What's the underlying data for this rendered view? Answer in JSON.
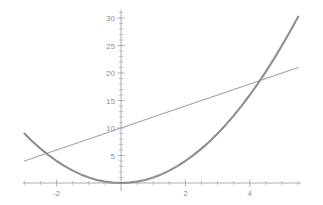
{
  "chart_data": {
    "type": "line",
    "title": "",
    "subtitle": "",
    "xlabel": "",
    "ylabel": "",
    "xlim": [
      -3.05,
      5.6
    ],
    "ylim": [
      -1.5,
      31.5
    ],
    "grid": false,
    "legend": "none",
    "background_color": "#ffffff",
    "axis_color": "#9a9aa2",
    "x_ticks_major": [
      -2,
      2,
      4
    ],
    "x_tick_labels": [
      "-2",
      "2",
      "4"
    ],
    "x_ticks_minor": [
      -3,
      -2.5,
      -1.5,
      -1,
      -0.5,
      0.5,
      1,
      1.5,
      2.5,
      3,
      3.5,
      4.5,
      5,
      5.5
    ],
    "y_ticks_major": [
      5,
      10,
      15,
      20,
      25,
      30
    ],
    "y_tick_labels": [
      "5",
      "10",
      "15",
      "20",
      "25",
      "30"
    ],
    "y_ticks_minor": [
      1,
      2,
      3,
      4,
      6,
      7,
      8,
      9,
      11,
      12,
      13,
      14,
      16,
      17,
      18,
      19,
      21,
      22,
      23,
      24,
      26,
      27,
      28,
      29,
      31
    ],
    "series": [
      {
        "name": "parabola",
        "expression": "y = x^2",
        "color": "#8e8e96",
        "stroke_width": 2.1,
        "x": [
          -3.0,
          -2.75,
          -2.5,
          -2.25,
          -2.0,
          -1.75,
          -1.5,
          -1.25,
          -1.0,
          -0.75,
          -0.5,
          -0.25,
          0.0,
          0.25,
          0.5,
          0.75,
          1.0,
          1.25,
          1.5,
          1.75,
          2.0,
          2.25,
          2.5,
          2.75,
          3.0,
          3.25,
          3.5,
          3.75,
          4.0,
          4.25,
          4.5,
          4.75,
          5.0,
          5.25,
          5.5
        ],
        "y": [
          9.0,
          7.5625,
          6.25,
          5.0625,
          4.0,
          3.0625,
          2.25,
          1.5625,
          1.0,
          0.5625,
          0.25,
          0.0625,
          0.0,
          0.0625,
          0.25,
          0.5625,
          1.0,
          1.5625,
          2.25,
          3.0625,
          4.0,
          5.0625,
          6.25,
          7.5625,
          9.0,
          10.5625,
          12.25,
          14.0625,
          16.0,
          18.0625,
          20.25,
          22.5625,
          25.0,
          27.5625,
          30.25
        ]
      },
      {
        "name": "tangent-line",
        "expression": "y = 2x + 10",
        "color": "#a3a3ad",
        "stroke_width": 1.2,
        "x": [
          -3.0,
          5.5
        ],
        "y": [
          4.0,
          21.0
        ]
      }
    ],
    "annotations": [],
    "intersections": [
      {
        "x": -2.4,
        "y": 5.2
      },
      {
        "x": 4.4,
        "y": 18.8
      }
    ]
  },
  "figure": {
    "name": "quadratic-and-line-plot"
  }
}
